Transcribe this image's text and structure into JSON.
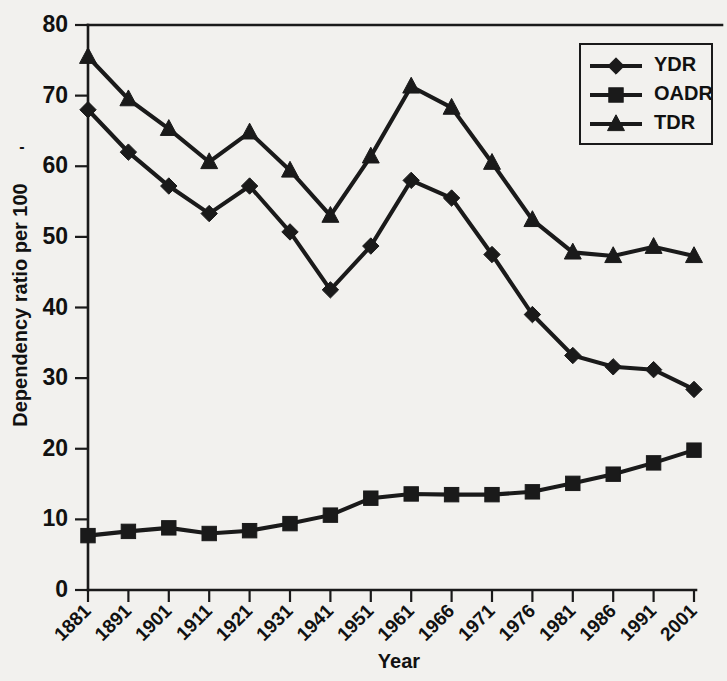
{
  "chart_data": {
    "type": "line",
    "title": "",
    "xlabel": "Year",
    "ylabel": "Dependency ratio per 100",
    "ylabel_superscript": "-",
    "categories": [
      "1881",
      "1891",
      "1901",
      "1911",
      "1921",
      "1931",
      "1941",
      "1951",
      "1961",
      "1966",
      "1971",
      "1976",
      "1981",
      "1986",
      "1991",
      "2001"
    ],
    "ylim": [
      0,
      80
    ],
    "yticks": [
      "0",
      "10",
      "20",
      "30",
      "40",
      "50",
      "60",
      "70",
      "80"
    ],
    "grid": false,
    "legend_position": "top-right",
    "series": [
      {
        "name": "YDR",
        "marker": "diamond",
        "values": [
          68.0,
          62.0,
          57.2,
          53.3,
          57.2,
          50.7,
          42.5,
          48.7,
          58.0,
          55.5,
          47.5,
          39.0,
          33.2,
          31.6,
          31.2,
          28.4
        ]
      },
      {
        "name": "OADR",
        "marker": "square",
        "values": [
          7.7,
          8.3,
          8.8,
          8.0,
          8.4,
          9.4,
          10.6,
          13.0,
          13.6,
          13.5,
          13.5,
          13.9,
          15.1,
          16.4,
          18.0,
          19.8
        ]
      },
      {
        "name": "TDR",
        "marker": "triangle",
        "values": [
          75.5,
          69.5,
          65.3,
          60.6,
          64.8,
          59.4,
          53.0,
          61.4,
          71.3,
          68.3,
          60.5,
          52.4,
          47.8,
          47.3,
          48.6,
          47.3
        ]
      }
    ],
    "colors": {
      "ink": "#1a1a1a",
      "background": "#f2f1ee"
    }
  },
  "legend": {
    "items": [
      {
        "label": "YDR"
      },
      {
        "label": "OADR"
      },
      {
        "label": "TDR"
      }
    ]
  },
  "axes": {
    "x_title": "Year",
    "y_title": "Dependency ratio per 100"
  }
}
